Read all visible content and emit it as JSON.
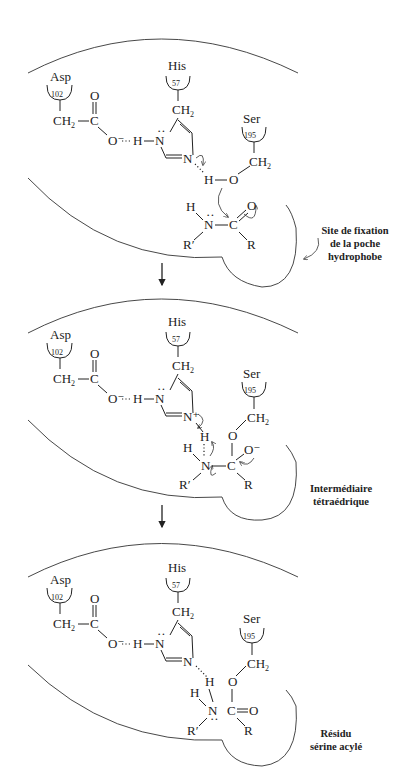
{
  "residues": {
    "asp": {
      "name": "Asp",
      "number": "102"
    },
    "his": {
      "name": "His",
      "number": "57"
    },
    "ser": {
      "name": "Ser",
      "number": "195"
    }
  },
  "atoms": {
    "ch2": "CH",
    "sub2": "2",
    "c": "C",
    "o": "O",
    "o_minus": "O⁻",
    "n": "N",
    "n_plus": "N⁺",
    "h": "H",
    "r": "R",
    "r_prime": "R′",
    "dh": "··H",
    "bond_dots": "¨"
  },
  "steps": [
    {
      "label_line1": "Site de fixation",
      "label_line2": "de la poche",
      "label_line3": "hydrophobe"
    },
    {
      "label_line1": "Intermédiaire",
      "label_line2": "tétraédrique"
    },
    {
      "label_line1": "Résidu",
      "label_line2": "sérine acylé"
    }
  ],
  "arrows": [
    "step1-to-step2",
    "step2-to-step3"
  ]
}
